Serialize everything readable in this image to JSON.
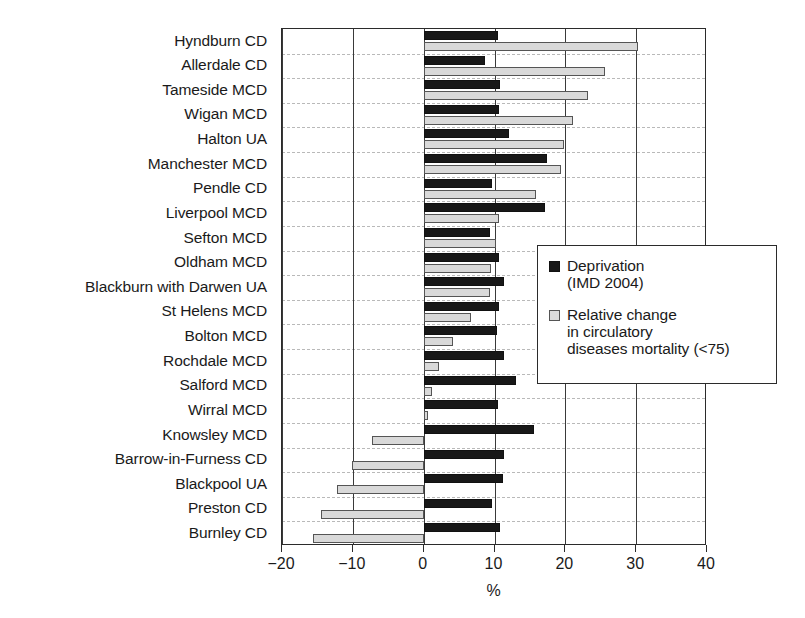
{
  "chart_data": {
    "type": "bar",
    "orientation": "horizontal",
    "title": "",
    "xlabel": "%",
    "ylabel": "",
    "xlim": [
      -20,
      40
    ],
    "xticks": [
      -20,
      -10,
      0,
      10,
      20,
      30,
      40
    ],
    "xtick_labels": [
      "-20",
      "-10",
      "0",
      "10",
      "20",
      "30",
      "40"
    ],
    "grid": "vertical gridlines at each x tick; dashed horizontal separators between categories",
    "legend_position": "middle-right inside plot",
    "categories": [
      "Hyndburn CD",
      "Allerdale CD",
      "Tameside MCD",
      "Wigan MCD",
      "Halton UA",
      "Manchester MCD",
      "Pendle CD",
      "Liverpool MCD",
      "Sefton MCD",
      "Oldham MCD",
      "Blackburn with Darwen UA",
      "St Helens MCD",
      "Bolton MCD",
      "Rochdale MCD",
      "Salford MCD",
      "Wirral MCD",
      "Knowsley MCD",
      "Barrow-in-Furness CD",
      "Blackpool UA",
      "Preston CD",
      "Burnley CD"
    ],
    "series": [
      {
        "name": "Deprivation (IMD 2004)",
        "color": "#181818",
        "values": [
          10.5,
          8.7,
          10.8,
          10.7,
          12.1,
          17.4,
          9.6,
          17.2,
          9.3,
          10.7,
          11.4,
          10.7,
          10.4,
          11.4,
          13.1,
          10.5,
          15.6,
          11.3,
          11.2,
          9.7,
          10.8
        ]
      },
      {
        "name": "Relative change in circulatory diseases mortality (<75)",
        "color": "#d9d9d9",
        "values": [
          30.3,
          25.6,
          23.2,
          21.1,
          19.8,
          19.4,
          15.8,
          10.6,
          10.2,
          9.5,
          9.3,
          6.7,
          4.1,
          2.1,
          1.2,
          0.6,
          -7.3,
          -10.1,
          -12.3,
          -14.5,
          -15.6
        ]
      }
    ]
  },
  "legend": {
    "entries": [
      {
        "label": "Deprivation\n(IMD 2004)",
        "swatch": "black-square"
      },
      {
        "label": "Relative change\nin circulatory\ndiseases mortality (<75)",
        "swatch": "light-gray-square"
      }
    ]
  }
}
